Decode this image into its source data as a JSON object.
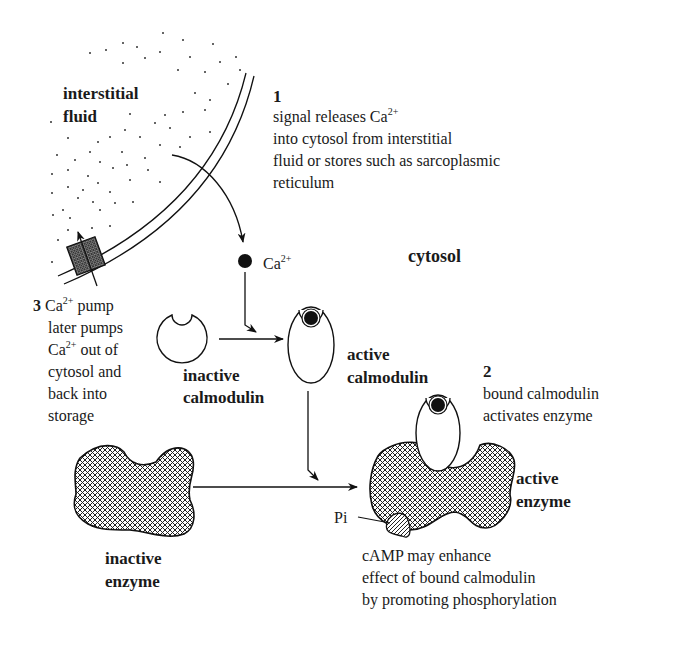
{
  "regions": {
    "interstitial": [
      "interstitial",
      "fluid"
    ],
    "cytosol": "cytosol"
  },
  "ion": {
    "symbol": "Ca",
    "charge": "2+"
  },
  "steps": {
    "step1": {
      "number": "1",
      "line1_prefix": "signal releases Ca",
      "line1_sup": "2+",
      "line2": "into cytosol from interstitial",
      "line3": "fluid or stores such as sarcoplasmic",
      "line4": "reticulum"
    },
    "step2": {
      "number": "2",
      "line1": "bound calmodulin",
      "line2": "activates enzyme"
    },
    "step3": {
      "number": "3",
      "line1_prefix": "Ca",
      "line1_sup": "2+",
      "line1_suffix": " pump",
      "line2": "later pumps",
      "line3_prefix": "Ca",
      "line3_sup": "2+",
      "line3_suffix": " out of",
      "line4": "cytosol and",
      "line5": "back into",
      "line6": "storage"
    }
  },
  "molecules": {
    "inactive_calmodulin": [
      "inactive",
      "calmodulin"
    ],
    "active_calmodulin": [
      "active",
      "calmodulin"
    ],
    "inactive_enzyme": [
      "inactive",
      "enzyme"
    ],
    "active_enzyme": [
      "active",
      "enzyme"
    ],
    "phosphate": "Pi"
  },
  "note": {
    "line1": "cAMP may enhance",
    "line2": "effect of bound calmodulin",
    "line3": "by promoting phosphorylation"
  }
}
